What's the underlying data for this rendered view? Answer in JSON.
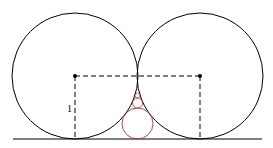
{
  "diagram": {
    "label_radius": "1",
    "colors": {
      "stroke": "#000000",
      "inscribed": "#b03030"
    },
    "large_circles": [
      {
        "cx": 75,
        "cy": 76,
        "r": 63
      },
      {
        "cx": 200,
        "cy": 76,
        "r": 63
      }
    ],
    "inscribed_circles": [
      {
        "cx": 137.5,
        "cy": 123.5,
        "r": 15.5
      },
      {
        "cx": 137.5,
        "cy": 103,
        "r": 5
      },
      {
        "cx": 137.5,
        "cy": 95.5,
        "r": 2.5
      }
    ],
    "ground_line": {
      "x1": 13,
      "x2": 262,
      "y": 139
    },
    "centers": [
      {
        "x": 75,
        "y": 76
      },
      {
        "x": 200,
        "y": 76
      }
    ]
  }
}
